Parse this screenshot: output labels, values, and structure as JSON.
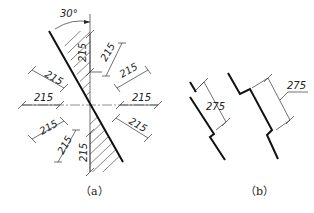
{
  "figure_a": {
    "angle_label": "30°",
    "dimension_value": "215",
    "dimensions": [
      "215",
      "215",
      "215",
      "215",
      "215",
      "215",
      "215",
      "215",
      "215",
      "215"
    ],
    "caption": "（a）"
  },
  "figure_b": {
    "left_dimension": "275",
    "right_dimension": "275",
    "caption": "（b）"
  },
  "colors": {
    "line": "#111111",
    "thin": "#333333",
    "background": "#ffffff"
  }
}
